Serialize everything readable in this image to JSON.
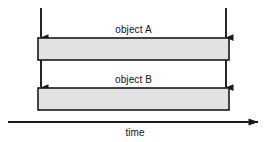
{
  "diagram": {
    "title_hidden": "",
    "background_color": "#ffffff",
    "line_color": "#1a1a1a",
    "bar_fill_color": "#e2e2e2",
    "bar_stroke_color": "#1a1a1a",
    "text_color": "#111111",
    "bars": [
      {
        "id": "object-a",
        "label": "object A",
        "x": 38,
        "y": 38,
        "width": 191,
        "height": 22
      },
      {
        "id": "object-b",
        "label": "object B",
        "x": 38,
        "y": 88,
        "width": 191,
        "height": 22
      }
    ],
    "event_arrows": [
      {
        "id": "left-start-arrow",
        "x": 41,
        "y1": 8,
        "y2": 38
      },
      {
        "id": "right-start-arrow",
        "x": 226,
        "y1": 8,
        "y2": 38
      },
      {
        "id": "left-end-arrow",
        "x": 41,
        "y1": 60,
        "y2": 88
      },
      {
        "id": "right-end-arrow",
        "x": 226,
        "y1": 60,
        "y2": 88
      }
    ],
    "time_axis": {
      "label": "time",
      "x1": 8,
      "x2": 262,
      "y": 122
    }
  }
}
